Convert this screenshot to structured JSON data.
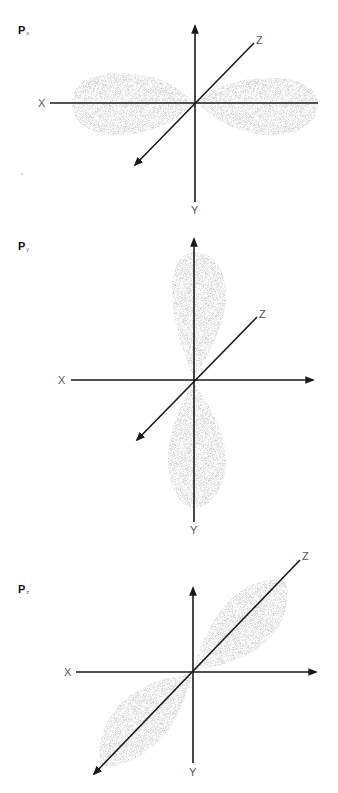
{
  "orbitals": [
    {
      "id": "px",
      "title_main": "P",
      "title_sub": "x",
      "axis_labels": {
        "x": "X",
        "y": "Y",
        "z": "Z"
      },
      "lobe_orientation": "horizontal (along X axis)"
    },
    {
      "id": "py",
      "title_main": "P",
      "title_sub": "y",
      "axis_labels": {
        "x": "X",
        "y": "Y",
        "z": "Z"
      },
      "lobe_orientation": "vertical (along Y axis)"
    },
    {
      "id": "pz",
      "title_main": "P",
      "title_sub": "z",
      "axis_labels": {
        "x": "X",
        "y": "Y",
        "z": "Z"
      },
      "lobe_orientation": "diagonal (along Z axis)"
    }
  ],
  "colors": {
    "axis": "#1a1a1a",
    "lobe": "#bdbdbd",
    "label": "#555555"
  }
}
